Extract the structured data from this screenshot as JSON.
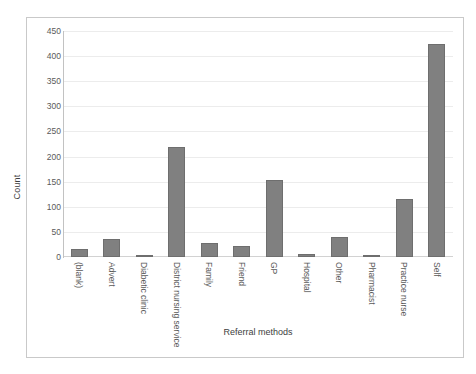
{
  "top_caption": "",
  "chart_data": {
    "type": "bar",
    "title": "",
    "xlabel": "Referral methods",
    "ylabel": "Count",
    "categories": [
      "(blank)",
      "Advert",
      "Diabetic clinic",
      "District nursing service",
      "Family",
      "Friend",
      "GP",
      "Hospital",
      "Other",
      "Pharmacist",
      "Practice nurse",
      "Self"
    ],
    "values": [
      15,
      35,
      2,
      220,
      27,
      21,
      153,
      6,
      40,
      2,
      115,
      425
    ],
    "ylim": [
      0,
      450
    ],
    "ytick_step": 50,
    "yticks": [
      0,
      50,
      100,
      150,
      200,
      250,
      300,
      350,
      400,
      450
    ],
    "ytick_labels": [
      "0",
      "50",
      "100",
      "150",
      "200",
      "250",
      "300",
      "350",
      "400",
      "450"
    ],
    "grid": true,
    "grid_axis": "y",
    "legend": false,
    "legend_position": "none",
    "bar_color": "#808080",
    "bar_border_color": "#6e6e6e",
    "gridline_color": "#ececec",
    "axis_color": "#c2c2c2",
    "frame_color": "#c9c9c9",
    "background": "#ffffff",
    "tick_label_color": "#5a5a5a",
    "axis_title_color": "#3d3d3d"
  }
}
